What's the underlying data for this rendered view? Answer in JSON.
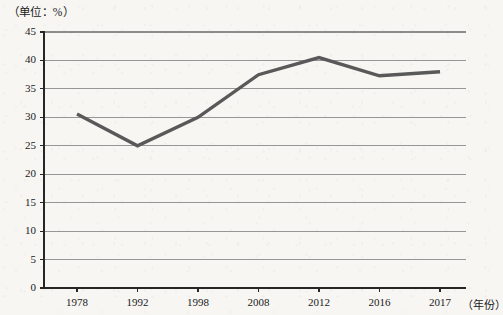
{
  "chart_data": {
    "type": "line",
    "title": "（单位：%）",
    "xlabel": "（年份）",
    "ylabel": "",
    "categories": [
      "1978",
      "1992",
      "1998",
      "2008",
      "2012",
      "2016",
      "2017"
    ],
    "values": [
      30.6,
      25.0,
      30.0,
      37.5,
      40.5,
      37.3,
      38.0
    ],
    "series": [
      {
        "name": "比重",
        "values": [
          30.6,
          25.0,
          30.0,
          37.5,
          40.5,
          37.3,
          38.0
        ]
      }
    ],
    "ylim": [
      0,
      45
    ],
    "yticks": [
      0,
      5,
      10,
      15,
      20,
      25,
      30,
      35,
      40,
      45
    ],
    "ytick_labels": [
      "0",
      "5",
      "10",
      "15",
      "20",
      "25",
      "30",
      "35",
      "40",
      "45"
    ],
    "xtick_labels": [
      "1978",
      "1992",
      "1998",
      "2008",
      "2012",
      "2016",
      "2017"
    ],
    "grid": true,
    "grid_axis": "y",
    "legend": "none",
    "line_color": "#595959",
    "grid_color": "#8c8c8c",
    "axis_color": "#262626",
    "background_color": "#f7f6f3"
  },
  "axis": {
    "unit_note": "（单位：%）",
    "year_note": "（年份）"
  }
}
